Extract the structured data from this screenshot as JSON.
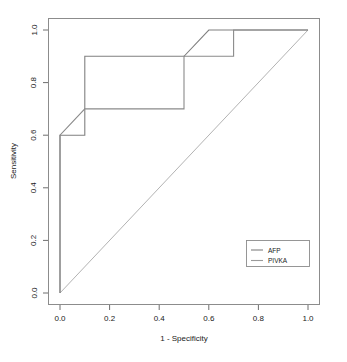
{
  "chart_data": {
    "type": "line",
    "title": "",
    "xlabel": "1 - Specificity",
    "ylabel": "Sensitivity",
    "xlim": [
      0.0,
      1.0
    ],
    "ylim": [
      0.0,
      1.0
    ],
    "xticks": [
      "0.0",
      "0.2",
      "0.4",
      "0.6",
      "0.8",
      "1.0"
    ],
    "xtick_values": [
      0.0,
      0.2,
      0.4,
      0.6,
      0.8,
      1.0
    ],
    "yticks": [
      "0.0",
      "0.2",
      "0.4",
      "0.6",
      "0.8",
      "1.0"
    ],
    "ytick_values": [
      0.0,
      0.2,
      0.4,
      0.6,
      0.8,
      1.0
    ],
    "grid": false,
    "legend_position": "bottom-right",
    "reference_line": {
      "name": "chance-diagonal",
      "points": [
        [
          0.0,
          0.0
        ],
        [
          1.0,
          1.0
        ]
      ],
      "color": "#b3b3b3"
    },
    "series": [
      {
        "name": "AFP",
        "color": "#808080",
        "points": [
          [
            0.0,
            0.0
          ],
          [
            0.0,
            0.6
          ],
          [
            0.1,
            0.6
          ],
          [
            0.1,
            0.9
          ],
          [
            0.5,
            0.9
          ],
          [
            0.6,
            1.0
          ],
          [
            1.0,
            1.0
          ]
        ]
      },
      {
        "name": "PIVKA",
        "color": "#8a8a8a",
        "points": [
          [
            0.0,
            0.0
          ],
          [
            0.0,
            0.6
          ],
          [
            0.1,
            0.7
          ],
          [
            0.5,
            0.7
          ],
          [
            0.5,
            0.9
          ],
          [
            0.7,
            0.9
          ],
          [
            0.7,
            1.0
          ],
          [
            1.0,
            1.0
          ]
        ]
      }
    ]
  },
  "legend": {
    "entries": [
      {
        "label": "AFP",
        "color": "#808080"
      },
      {
        "label": "PIVKA",
        "color": "#9a9a9a"
      }
    ]
  },
  "colors": {
    "frame": "#8c8c8c",
    "axis": "#6e6e6e",
    "text": "#1a1a1a",
    "background": "#ffffff"
  }
}
